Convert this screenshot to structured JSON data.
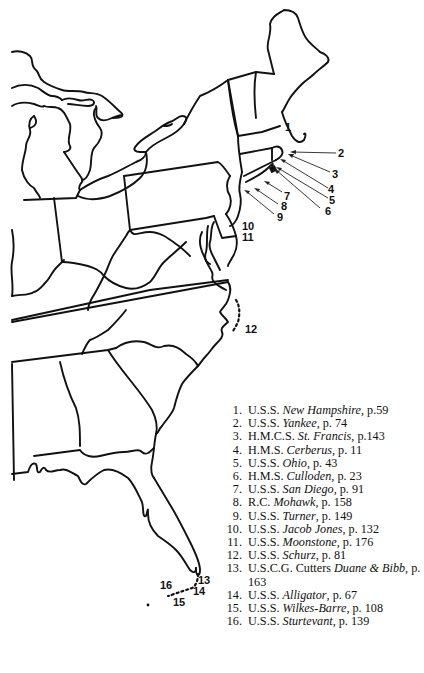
{
  "map": {
    "region": "Eastern United States",
    "markers": [
      {
        "id": "1",
        "label": "1",
        "x": 288,
        "y": 128
      },
      {
        "id": "2",
        "label": "2",
        "x": 338,
        "y": 157
      },
      {
        "id": "3",
        "label": "3",
        "x": 330,
        "y": 177
      },
      {
        "id": "4",
        "label": "4",
        "x": 330,
        "y": 191
      },
      {
        "id": "5",
        "label": "5",
        "x": 330,
        "y": 202
      },
      {
        "id": "6",
        "label": "6",
        "x": 322,
        "y": 213
      },
      {
        "id": "7",
        "label": "7",
        "x": 284,
        "y": 197
      },
      {
        "id": "8",
        "label": "8",
        "x": 281,
        "y": 209
      },
      {
        "id": "9",
        "label": "9",
        "x": 277,
        "y": 220
      },
      {
        "id": "10",
        "label": "10",
        "x": 244,
        "y": 230
      },
      {
        "id": "11",
        "label": "11",
        "x": 244,
        "y": 241
      },
      {
        "id": "12",
        "label": "12",
        "x": 246,
        "y": 333
      },
      {
        "id": "13",
        "label": "13",
        "x": 198,
        "y": 584
      },
      {
        "id": "14",
        "label": "14",
        "x": 193,
        "y": 595
      },
      {
        "id": "15",
        "label": "15",
        "x": 173,
        "y": 604
      },
      {
        "id": "16",
        "label": "16",
        "x": 160,
        "y": 586
      }
    ]
  },
  "legend": {
    "items": [
      {
        "num": "1.",
        "prefix": "U.S.S. ",
        "name": "New Hampshire",
        "suffix": ", p.59"
      },
      {
        "num": "2.",
        "prefix": "U.S.S. ",
        "name": "Yankee",
        "suffix": ", p. 74"
      },
      {
        "num": "3.",
        "prefix": "H.M.C.S. ",
        "name": "St. Francis",
        "suffix": ", p.143"
      },
      {
        "num": "4.",
        "prefix": "H.M.S. ",
        "name": "Cerberus",
        "suffix": ", p. 11"
      },
      {
        "num": "5.",
        "prefix": "U.S.S. ",
        "name": "Ohio",
        "suffix": ", p. 43"
      },
      {
        "num": "6.",
        "prefix": "H.M.S. ",
        "name": "Culloden",
        "suffix": ", p. 23"
      },
      {
        "num": "7.",
        "prefix": "U.S.S. ",
        "name": "San Diego",
        "suffix": ", p. 91"
      },
      {
        "num": "8.",
        "prefix": "R.C. ",
        "name": "Mohawk",
        "suffix": ", p. 158"
      },
      {
        "num": "9.",
        "prefix": "U.S.S. ",
        "name": "Turner",
        "suffix": ", p. 149"
      },
      {
        "num": "10.",
        "prefix": "U.S.S. ",
        "name": "Jacob Jones",
        "suffix": ", p. 132"
      },
      {
        "num": "11.",
        "prefix": "U.S.S. ",
        "name": "Moonstone",
        "suffix": ", p. 176"
      },
      {
        "num": "12.",
        "prefix": "U.S.S. ",
        "name": "Schurz",
        "suffix": ", p. 81"
      },
      {
        "num": "13.",
        "prefix": "U.S.C.G. Cutters ",
        "name": "Duane & Bibb",
        "suffix": ", p. 163"
      },
      {
        "num": "14.",
        "prefix": "U.S.S. ",
        "name": "Alligator",
        "suffix": ", p. 67"
      },
      {
        "num": "15.",
        "prefix": "U.S.S. ",
        "name": "Wilkes-Barre",
        "suffix": ", p. 108"
      },
      {
        "num": "16.",
        "prefix": "U.S.S. ",
        "name": "Sturtevant",
        "suffix": ", p. 139"
      }
    ]
  }
}
